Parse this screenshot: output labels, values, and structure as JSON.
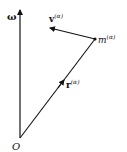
{
  "diagram": {
    "origin_label": "O",
    "omega_label": "ω",
    "velocity_label": "v",
    "velocity_superscript": "(α)",
    "position_label": "r",
    "position_superscript": "(α)",
    "mass_label": "m",
    "mass_superscript": "(α)"
  }
}
